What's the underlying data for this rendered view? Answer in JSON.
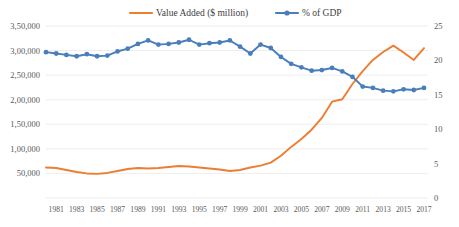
{
  "chart_data": {
    "type": "line",
    "title": "",
    "xlabel": "",
    "ylabel": "",
    "grid": true,
    "legend_position": "top-center",
    "x": [
      1980,
      1981,
      1982,
      1983,
      1984,
      1985,
      1986,
      1987,
      1988,
      1989,
      1990,
      1991,
      1992,
      1993,
      1994,
      1995,
      1996,
      1997,
      1998,
      1999,
      2000,
      2001,
      2002,
      2003,
      2004,
      2005,
      2006,
      2007,
      2008,
      2009,
      2010,
      2011,
      2012,
      2013,
      2014,
      2015,
      2016,
      2017
    ],
    "xtick_labels": [
      "1981",
      "1983",
      "1985",
      "1987",
      "1989",
      "1991",
      "1993",
      "1995",
      "1997",
      "1999",
      "2001",
      "2003",
      "2005",
      "2007",
      "2009",
      "2011",
      "2013",
      "2015",
      "2017"
    ],
    "left_axis": {
      "ticks": [
        0,
        50000,
        100000,
        150000,
        200000,
        250000,
        300000,
        350000
      ],
      "tick_labels": [
        "0",
        "50,000",
        "1,00,000",
        "1,50,000",
        "2,00,000",
        "2,50,000",
        "3,00,000",
        "3,50,000"
      ],
      "ylim": [
        0,
        350000
      ]
    },
    "right_axis": {
      "ticks": [
        0,
        5,
        10,
        15,
        20,
        25
      ],
      "tick_labels": [
        "0",
        "5",
        "10",
        "15",
        "20",
        "25"
      ],
      "ylim": [
        0,
        25
      ]
    },
    "series": [
      {
        "name": "Value Added ($ million)",
        "axis": "left",
        "color": "#ED7D31",
        "markers": false,
        "values": [
          62000,
          61000,
          57000,
          53000,
          50000,
          49000,
          51000,
          55000,
          59000,
          61000,
          60000,
          61000,
          63000,
          65000,
          64000,
          62000,
          60000,
          58000,
          55000,
          57000,
          62000,
          66000,
          72000,
          86000,
          104000,
          120000,
          139000,
          163000,
          196000,
          201000,
          232000,
          258000,
          281000,
          297000,
          310000,
          296000,
          281000,
          305000
        ]
      },
      {
        "name": "% of GDP",
        "axis": "right",
        "color": "#4A7EBB",
        "markers": true,
        "values": [
          21.2,
          21.0,
          20.8,
          20.6,
          20.9,
          20.6,
          20.7,
          21.3,
          21.7,
          22.4,
          22.9,
          22.3,
          22.4,
          22.6,
          23.0,
          22.3,
          22.5,
          22.6,
          22.9,
          22.0,
          21.0,
          22.3,
          21.8,
          20.5,
          19.5,
          19.0,
          18.5,
          18.6,
          18.9,
          18.4,
          17.6,
          16.2,
          16.0,
          15.6,
          15.5,
          15.8,
          15.7,
          16.0
        ]
      }
    ]
  },
  "legend": {
    "items": [
      {
        "label": "Value Added ($ million)",
        "color": "#ED7D31",
        "marker": false
      },
      {
        "label": "% of GDP",
        "color": "#4A7EBB",
        "marker": true
      }
    ]
  }
}
